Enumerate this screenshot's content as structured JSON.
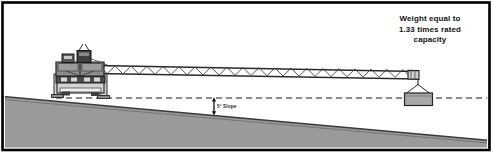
{
  "figure": {
    "background_color": "#ffffff",
    "border_color": "#000000"
  },
  "callouts": {
    "weight_note": {
      "line1": "Weight equal to",
      "line2": "1.33 times rated",
      "line3": "capacity"
    },
    "slope_label": "5° Slope"
  },
  "colors": {
    "ground_fill": "#9a9a9a",
    "ground_edge": "#3c3c3c",
    "machine_dark": "#3a3a3a",
    "machine_mid": "#6e6e6e",
    "machine_light": "#b4b4b4",
    "boom_fill": "#d8d8d8",
    "boom_stroke": "#2a2a2a",
    "load_fill": "#a8a8a8",
    "load_stroke": "#2a2a2a",
    "reference_line": "#1a1a1a",
    "text": "#121212"
  },
  "scene": {
    "reference_line_y": 98,
    "ground_left_y": 97,
    "ground_right_y": 140,
    "slope_degrees": 5,
    "crane_x": 85,
    "boom_tip_x": 418,
    "load_x": 419,
    "load_y": 80
  }
}
